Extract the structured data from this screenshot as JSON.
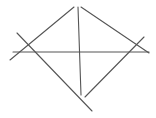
{
  "canvas": {
    "width": 156,
    "height": 118,
    "background": "#ffffff"
  },
  "style": {
    "stroke_color": "#555555",
    "stroke_width": 1.1
  },
  "lines": [
    {
      "name": "upper-left-edge",
      "x1": 10,
      "y1": 60,
      "x2": 74,
      "y2": 7
    },
    {
      "name": "upper-right-edge",
      "x1": 81,
      "y1": 7,
      "x2": 149,
      "y2": 53
    },
    {
      "name": "vertical-axis",
      "x1": 78,
      "y1": 7,
      "x2": 81,
      "y2": 95
    },
    {
      "name": "horizontal-axis",
      "x1": 13,
      "y1": 52,
      "x2": 149,
      "y2": 52
    },
    {
      "name": "lower-left-diagonal",
      "x1": 17,
      "y1": 33,
      "x2": 92,
      "y2": 111
    },
    {
      "name": "lower-right-diagonal",
      "x1": 144,
      "y1": 37,
      "x2": 85,
      "y2": 97
    }
  ]
}
